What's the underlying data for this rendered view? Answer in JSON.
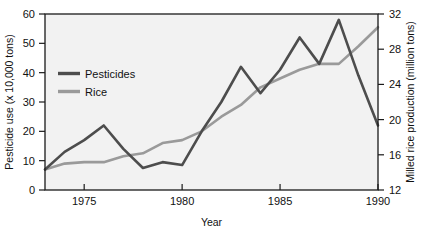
{
  "chart_data": {
    "type": "line",
    "title": "",
    "xlabel": "Year",
    "ylabel": "Pesticide use (x 10,000 tons)",
    "y2label": "Milled rice production (million tons)",
    "xlim": [
      1973,
      1990
    ],
    "ylim": [
      0,
      60
    ],
    "y2lim": [
      12,
      32
    ],
    "xticks": [
      1975,
      1980,
      1985,
      1990
    ],
    "xtick_labels": [
      "1975",
      "1980",
      "1985",
      "1990"
    ],
    "yticks": [
      0,
      10,
      20,
      30,
      40,
      50,
      60
    ],
    "ytick_labels": [
      "0",
      "10",
      "20",
      "30",
      "40",
      "50",
      "60"
    ],
    "y2ticks": [
      12,
      16,
      20,
      24,
      28,
      32
    ],
    "y2tick_labels": [
      "12",
      "16",
      "20",
      "24",
      "28",
      "32"
    ],
    "grid": false,
    "legend_position": "upper-left-inside",
    "x": [
      1973,
      1974,
      1975,
      1976,
      1977,
      1978,
      1979,
      1980,
      1981,
      1982,
      1983,
      1984,
      1985,
      1986,
      1987,
      1988,
      1989,
      1990
    ],
    "series": [
      {
        "name": "Pesticides",
        "axis": "left",
        "units": "x 10,000 tons",
        "color": "#4d4d4d",
        "values": [
          7,
          13,
          17,
          22,
          14,
          7.5,
          9.5,
          8.5,
          20,
          30,
          42,
          33,
          41,
          52,
          43,
          58,
          39,
          22
        ]
      },
      {
        "name": "Rice",
        "axis": "right",
        "units": "million tons",
        "color": "#9a9a9a",
        "values_left_scale": [
          7,
          9,
          9.5,
          9.5,
          11.5,
          12.5,
          16,
          17,
          20,
          25,
          29,
          35,
          38,
          41,
          43,
          43,
          49,
          55.5
        ],
        "values": [
          13.6,
          15.0,
          15.2,
          15.2,
          15.9,
          16.2,
          17.3,
          17.7,
          18.7,
          20.3,
          21.7,
          23.7,
          24.7,
          25.7,
          26.3,
          26.3,
          28.3,
          30.5
        ]
      }
    ],
    "legend": [
      {
        "label": "Pesticides",
        "color": "#4d4d4d"
      },
      {
        "label": "Rice",
        "color": "#9a9a9a"
      }
    ]
  },
  "axes": {
    "x_title": "Year",
    "y_left_title": "Pesticide use (x 10,000 tons)",
    "y_right_title": "Milled rice production (million tons)"
  },
  "legend": {
    "pesticides_label": "Pesticides",
    "rice_label": "Rice"
  },
  "colors": {
    "pesticides": "#4d4d4d",
    "rice": "#9a9a9a",
    "plot_background": "#f2f2f2",
    "frame": "#1a1a1a",
    "text": "#111111",
    "page_background": "#ffffff"
  },
  "ytick_0": "0",
  "ytick_10": "10",
  "ytick_20": "20",
  "ytick_30": "30",
  "ytick_40": "40",
  "ytick_50": "50",
  "ytick_60": "60",
  "y2tick_12": "12",
  "y2tick_16": "16",
  "y2tick_20": "20",
  "y2tick_24": "24",
  "y2tick_28": "28",
  "y2tick_32": "32",
  "xtick_1975": "1975",
  "xtick_1980": "1980",
  "xtick_1985": "1985",
  "xtick_1990": "1990"
}
